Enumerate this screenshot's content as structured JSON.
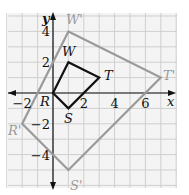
{
  "axes": {
    "x_label": "x",
    "y_label": "y",
    "x_ticks": [
      {
        "v": -2,
        "t": "−2"
      },
      {
        "v": 2,
        "t": "2"
      },
      {
        "v": 4,
        "t": "4"
      },
      {
        "v": 6,
        "t": "6"
      }
    ],
    "y_ticks": [
      {
        "v": 4,
        "t": "4"
      },
      {
        "v": 2,
        "t": "2"
      },
      {
        "v": -2,
        "t": "−2"
      },
      {
        "v": -4,
        "t": "−4"
      }
    ]
  },
  "original": {
    "name": "RSTW",
    "color": "#111111",
    "vertices": [
      {
        "label": "R",
        "x": 0,
        "y": 0
      },
      {
        "label": "S",
        "x": 1,
        "y": -1
      },
      {
        "label": "T",
        "x": 3,
        "y": 1
      },
      {
        "label": "W",
        "x": 1,
        "y": 2
      }
    ]
  },
  "image": {
    "name": "R'S'T'W'",
    "color": "#9a9a9a",
    "vertices": [
      {
        "label": "R'",
        "x": -2,
        "y": -2
      },
      {
        "label": "S'",
        "x": 1,
        "y": -5
      },
      {
        "label": "T'",
        "x": 7,
        "y": 1
      },
      {
        "label": "W'",
        "x": 1,
        "y": 4
      }
    ]
  },
  "grid": {
    "xmin": -3,
    "xmax": 8,
    "ymin": -6,
    "ymax": 5,
    "color": "#cfcfcf"
  }
}
